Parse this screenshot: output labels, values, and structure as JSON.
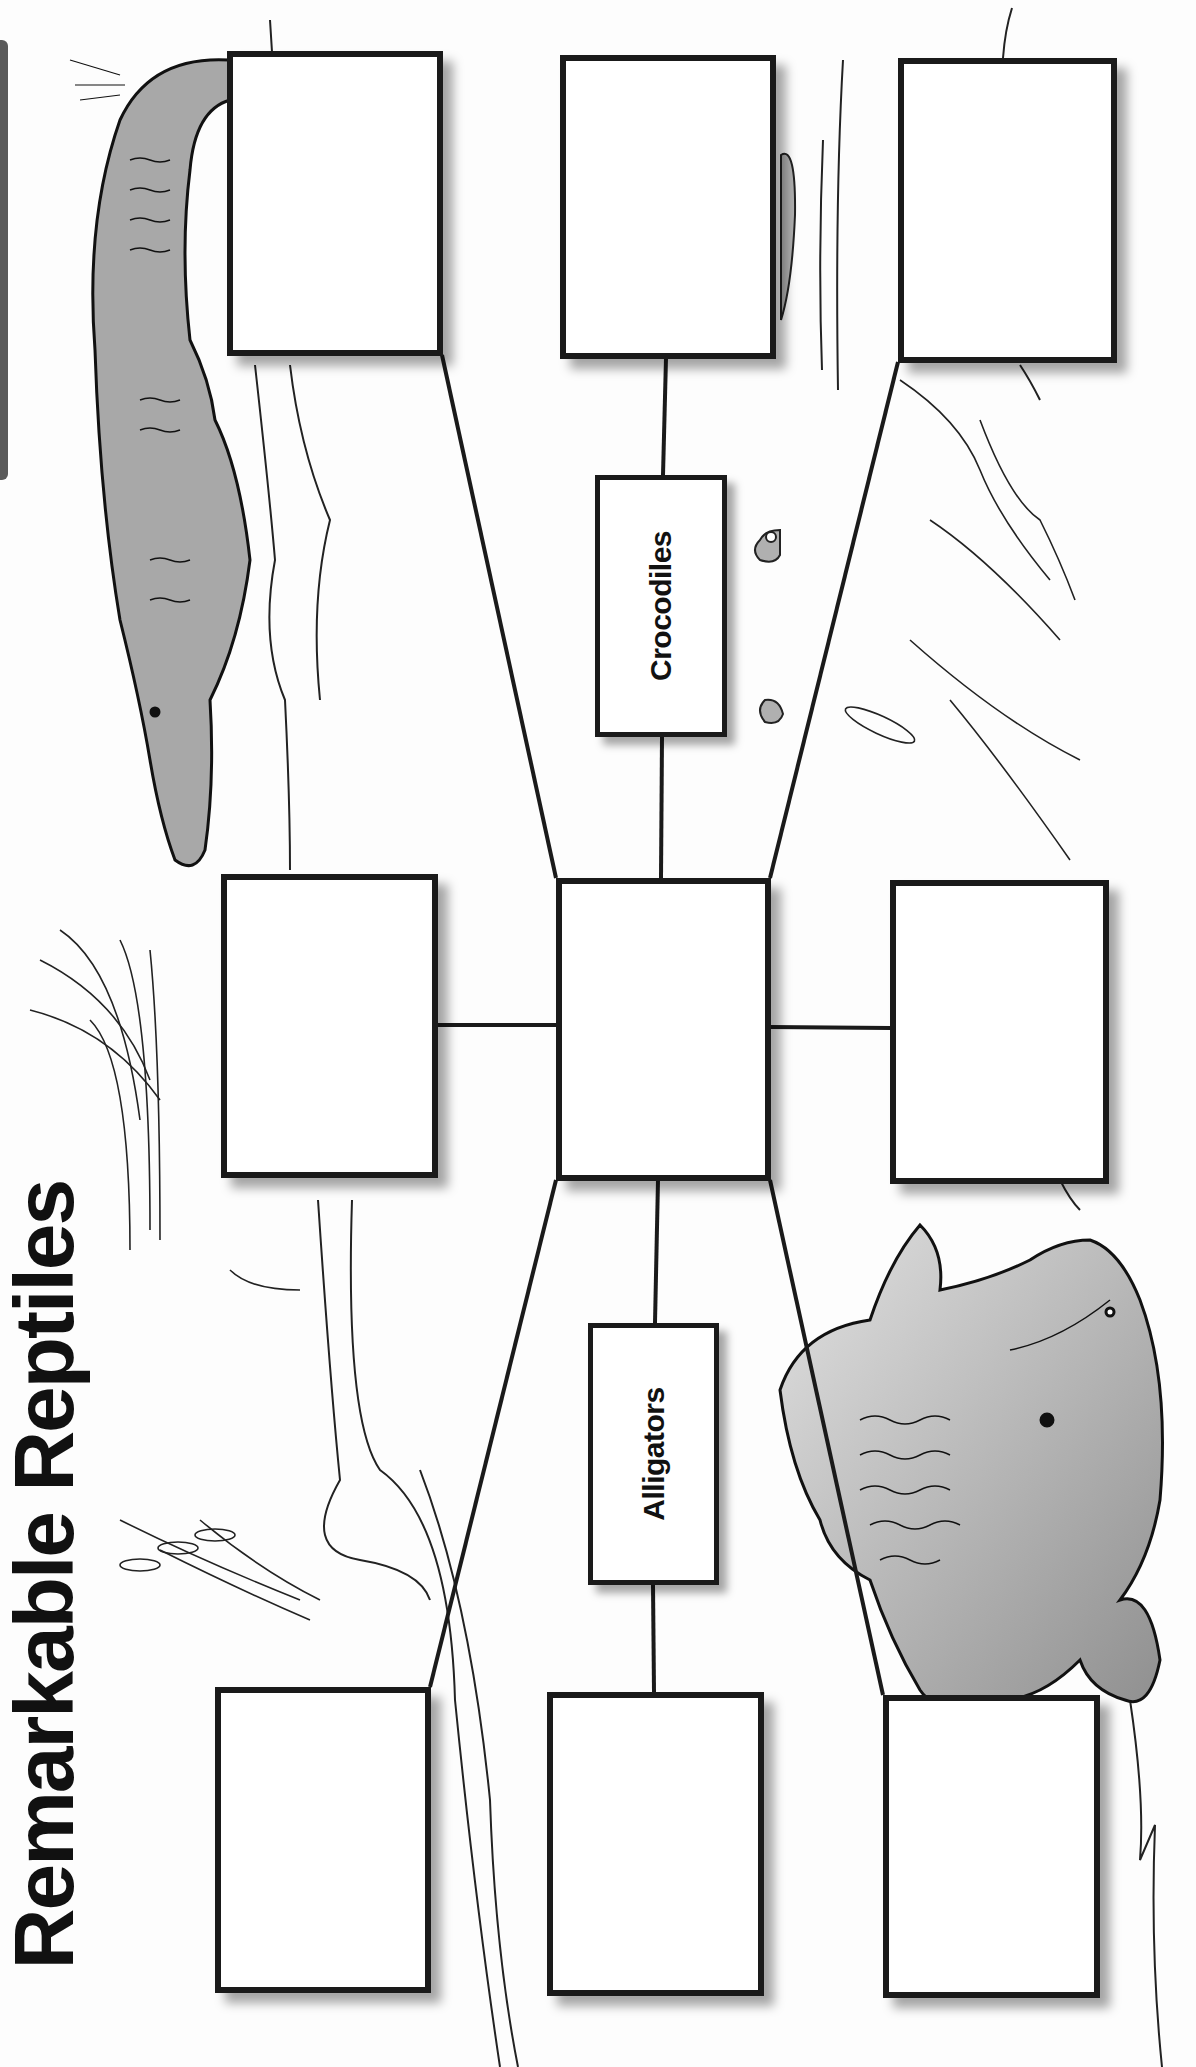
{
  "worksheet": {
    "title": "Remarkable Reptiles",
    "categories": [
      {
        "label": "Crocodiles"
      },
      {
        "label": "Alligators"
      }
    ],
    "answer_boxes": [
      {
        "id": "croc-left",
        "value": ""
      },
      {
        "id": "croc-middle",
        "value": ""
      },
      {
        "id": "croc-right",
        "value": ""
      },
      {
        "id": "shared-left",
        "value": ""
      },
      {
        "id": "shared-center",
        "value": ""
      },
      {
        "id": "shared-right",
        "value": ""
      },
      {
        "id": "alli-left",
        "value": ""
      },
      {
        "id": "alli-middle",
        "value": ""
      },
      {
        "id": "alli-right",
        "value": ""
      }
    ],
    "illustrations": [
      "crocodile-illustration",
      "alligator-illustration",
      "crocodile-eyes-in-water",
      "marsh-grass"
    ],
    "colors": {
      "ink": "#1a1a1a",
      "reptile_fill": "#a8a8a8",
      "edge_tab": "#5a5a5a",
      "paper": "#fdfdfd"
    }
  }
}
